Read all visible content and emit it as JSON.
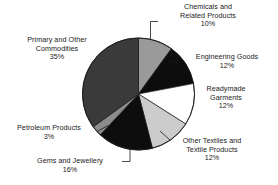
{
  "chart_data": {
    "type": "pie",
    "title": "",
    "subtitle": "",
    "xlabel": "",
    "ylabel": "",
    "grid": false,
    "legend_position": "none",
    "labels_outside_with_leader_lines": true,
    "start_angle_deg_from_12oclock": 0,
    "direction": "clockwise",
    "categories": [
      "Chemicals and Related Products",
      "Engineering Goods",
      "Readymade Garments",
      "Other Textiles and Textile Products",
      "Gems and Jewellery",
      "Petroleum Products",
      "Primary and Other Commodities"
    ],
    "values": [
      10,
      12,
      12,
      12,
      16,
      3,
      35
    ],
    "value_suffix": "%",
    "colors": [
      "#9a9a9a",
      "#0d0d0d",
      "#ffffff",
      "#cccccc",
      "#0d0d0d",
      "#8c8c8c",
      "#3a3a3a"
    ],
    "slices": [
      {
        "label": "Chemicals and Related Products",
        "value": 10,
        "value_text": "10%",
        "color": "#9a9a9a"
      },
      {
        "label": "Engineering Goods",
        "value": 12,
        "value_text": "12%",
        "color": "#0d0d0d"
      },
      {
        "label": "Readymade Garments",
        "value": 12,
        "value_text": "12%",
        "color": "#ffffff"
      },
      {
        "label": "Other Textiles and Textile Products",
        "value": 12,
        "value_text": "12%",
        "color": "#cccccc"
      },
      {
        "label": "Gems and Jewellery",
        "value": 16,
        "value_text": "16%",
        "color": "#0d0d0d"
      },
      {
        "label": "Petroleum Products",
        "value": 3,
        "value_text": "3%",
        "color": "#8c8c8c"
      },
      {
        "label": "Primary and Other Commodities",
        "value": 35,
        "value_text": "35%",
        "color": "#3a3a3a"
      }
    ]
  },
  "labels": {
    "chemicals": {
      "line1": "Chemicals and",
      "line2": "Related Products",
      "value": "10%"
    },
    "engineering": {
      "line1": "Engineering Goods",
      "value": "12%"
    },
    "readymade": {
      "line1": "Readymade",
      "line2": "Garments",
      "value": "12%"
    },
    "other_textiles": {
      "line1": "Other Textiles and",
      "line2": "Textile Products",
      "value": "12%"
    },
    "gems": {
      "line1": "Gems and Jewellery",
      "value": "16%"
    },
    "petroleum": {
      "line1": "Petroleum Products",
      "value": "3%"
    },
    "primary": {
      "line1": "Primary and Other",
      "line2": "Commodities",
      "value": "35%"
    }
  },
  "outline_color": "#1a1a1a"
}
